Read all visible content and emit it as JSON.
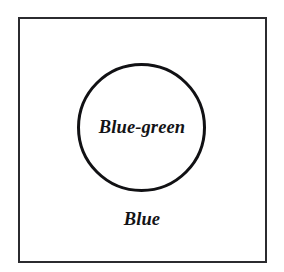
{
  "diagram": {
    "type": "euler-diagram",
    "background_color": "#ffffff",
    "outer_region": {
      "shape": "square",
      "label": "Blue",
      "stroke_color": "#2b2b2f",
      "fill_color": "#ffffff"
    },
    "inner_region": {
      "shape": "circle",
      "label": "Blue-green",
      "stroke_color": "#111114",
      "fill_color": "#ffffff"
    },
    "text_color": "#131316"
  }
}
